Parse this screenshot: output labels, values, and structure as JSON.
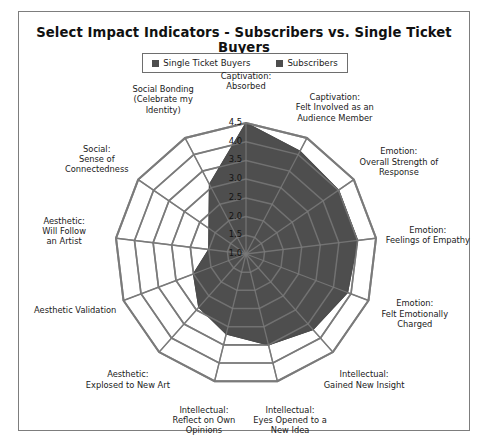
{
  "chart_data": {
    "type": "radar",
    "title": "Select Impact Indicators - Subscribers vs. Single Ticket Buyers",
    "grid": true,
    "legend_position": "top-center",
    "rlim": [
      1.0,
      4.5
    ],
    "tick_labels": [
      "1.0",
      "1.5",
      "2.0",
      "2.5",
      "3.0",
      "3.5",
      "4.0",
      "4.5"
    ],
    "tick_values": [
      1.0,
      1.5,
      2.0,
      2.5,
      3.0,
      3.5,
      4.0,
      4.5
    ],
    "categories": [
      "Captivation:\nAbsorbed",
      "Captivation:\nFelt Involved as an\nAudience Member",
      "Emotion:\nOverall Strength  of\nResponse",
      "Emotion:\nFeelings of Empathy",
      "Emotion:\nFelt Emotionally\nCharged",
      "Intellectual:\nGained New Insight",
      "Intellectual:\nEyes Opened to a\nNew Idea",
      "Intellectual:\nReflect on Own\nOpinions",
      "Aesthetic:\nExplosed to New Art",
      "Aesthetic Validation",
      "Aesthetic:\nWill Follow\nan Artist",
      "Social:\nSense of\nConnectedness",
      "Social Bonding\n(Celebrate my\nIdentity)"
    ],
    "series": [
      {
        "name": "Single Ticket Buyers",
        "color": "#4d4d4d",
        "values": [
          4.5,
          4.1,
          4.0,
          4.0,
          3.9,
          3.7,
          3.5,
          3.2,
          2.9,
          2.5,
          2.0,
          2.2,
          3.1
        ]
      },
      {
        "name": "Subscribers",
        "color": "#4d4d4d",
        "values": [
          4.5,
          4.1,
          4.0,
          4.0,
          3.9,
          3.7,
          3.5,
          3.2,
          2.9,
          2.5,
          2.0,
          2.2,
          3.1
        ]
      }
    ],
    "xlabel": "",
    "ylabel": ""
  },
  "legend": {
    "items": [
      {
        "label": "Single Ticket Buyers",
        "color": "#4d4d4d"
      },
      {
        "label": "Subscribers",
        "color": "#4d4d4d"
      }
    ]
  },
  "style": {
    "grid_color": "#7a7a7a",
    "fill_color": "#4d4d4d",
    "frame_color": "#7d7d7d",
    "text_color": "#1a1a1a"
  }
}
